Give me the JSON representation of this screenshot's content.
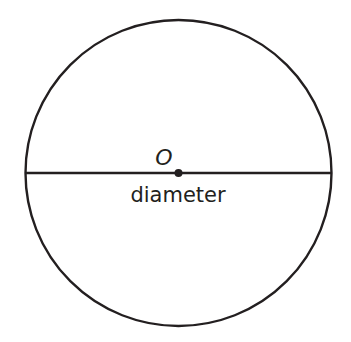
{
  "diagram": {
    "type": "circle-with-diameter",
    "center_label": "O",
    "diameter_label": "diameter",
    "stroke_color": "#231f20",
    "background": "#ffffff",
    "circle": {
      "cx": 178.5,
      "cy": 173,
      "r": 153
    }
  }
}
